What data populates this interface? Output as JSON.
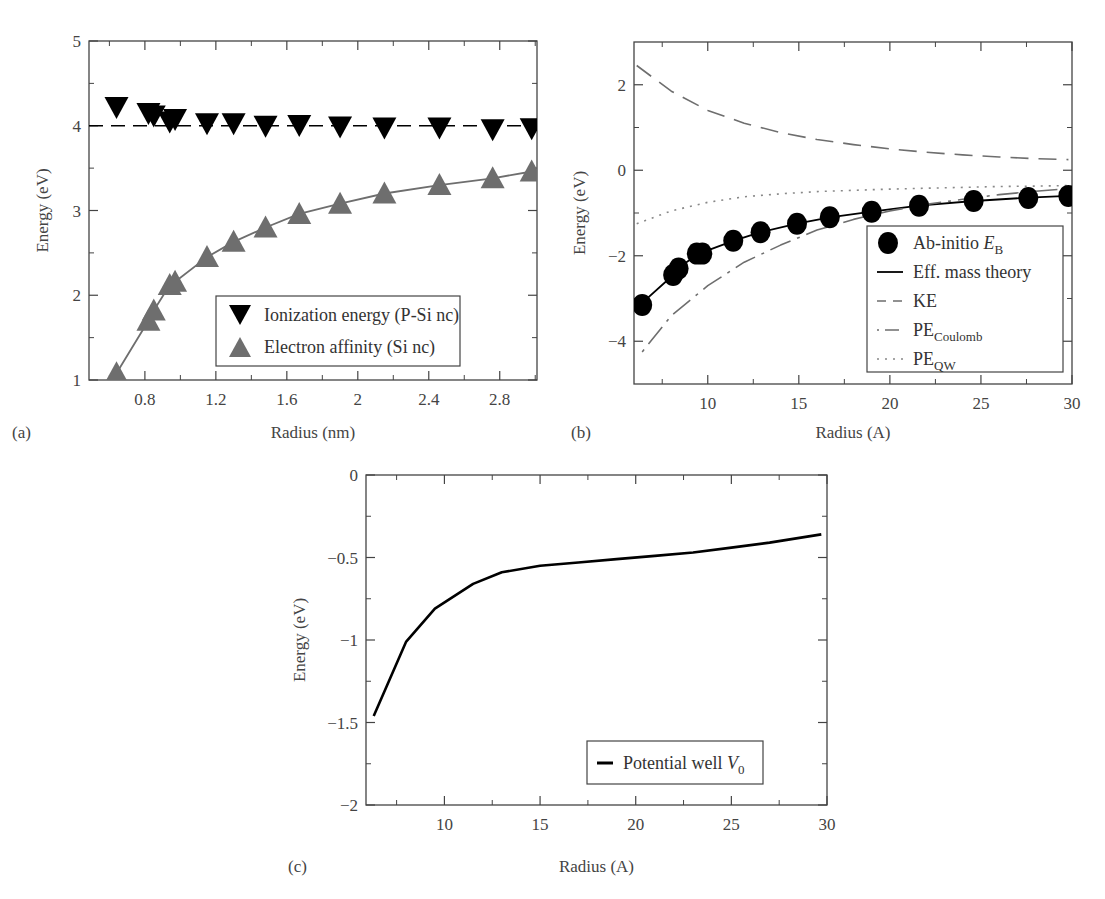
{
  "figure": {
    "panels": [
      "(a)",
      "(b)",
      "(c)"
    ]
  },
  "chart_data": [
    {
      "id": "a",
      "panel_label": "(a)",
      "type": "scatter",
      "title": "",
      "xlabel": "Radius (nm)",
      "ylabel": "Energy (eV)",
      "xlim": [
        0.485,
        3.01
      ],
      "ylim": [
        1,
        5
      ],
      "xticks": [
        0.8,
        1.2,
        1.6,
        2,
        2.4,
        2.8
      ],
      "xtick_labels": [
        "0.8",
        "1.2",
        "1.6",
        "2",
        "2.4",
        "2.8"
      ],
      "yticks": [
        1,
        2,
        3,
        4,
        5
      ],
      "ytick_labels": [
        "1",
        "2",
        "3",
        "4",
        "5"
      ],
      "x_minor_step": 0.2,
      "y_minor_step": 0.5,
      "grid": false,
      "legend_position": "lower right",
      "series": [
        {
          "name": "Ionization energy (P-Si nc)",
          "marker": "triangle-down",
          "color": "#000000",
          "x": [
            0.64,
            0.82,
            0.85,
            0.94,
            0.97,
            1.15,
            1.3,
            1.48,
            1.67,
            1.9,
            2.15,
            2.46,
            2.76,
            2.98
          ],
          "y": [
            4.22,
            4.15,
            4.12,
            4.05,
            4.08,
            4.03,
            4.03,
            4.0,
            4.01,
            3.99,
            3.98,
            3.98,
            3.96,
            3.97
          ]
        },
        {
          "name": "Electron affinity (Si nc)",
          "marker": "triangle-up",
          "color": "#6e6e6e",
          "line": "solid",
          "x": [
            0.64,
            0.82,
            0.85,
            0.94,
            0.97,
            1.15,
            1.3,
            1.48,
            1.67,
            1.9,
            2.15,
            2.46,
            2.76,
            2.98
          ],
          "y": [
            1.08,
            1.7,
            1.82,
            2.12,
            2.16,
            2.45,
            2.63,
            2.8,
            2.96,
            3.08,
            3.2,
            3.3,
            3.38,
            3.46
          ]
        },
        {
          "name": "reference",
          "marker": "none",
          "line": "dashed",
          "color": "#000000",
          "x": [
            0.485,
            3.01
          ],
          "y": [
            4.0,
            4.0
          ]
        }
      ]
    },
    {
      "id": "b",
      "panel_label": "(b)",
      "type": "line",
      "title": "",
      "xlabel": "Radius (A)",
      "ylabel": "Energy (eV)",
      "xlim": [
        5.95,
        30
      ],
      "ylim": [
        -5,
        3
      ],
      "xticks": [
        10,
        15,
        20,
        25,
        30
      ],
      "xtick_labels": [
        "10",
        "15",
        "20",
        "25",
        "30"
      ],
      "yticks": [
        -4,
        -2,
        0,
        2
      ],
      "ytick_labels": [
        "−4",
        "−2",
        "0",
        "2"
      ],
      "x_minor_step": 2.5,
      "y_minor_step": 1,
      "grid": false,
      "legend_position": "lower right",
      "series": [
        {
          "name": "Ab-initio E_B",
          "legend_main": "Ab-initio ",
          "legend_italic": "E",
          "legend_sub": "B",
          "marker": "circle",
          "color": "#000000",
          "x": [
            6.4,
            8.1,
            8.4,
            9.4,
            9.7,
            11.4,
            12.9,
            14.9,
            16.7,
            19.0,
            21.6,
            24.6,
            27.6,
            29.8
          ],
          "y": [
            -3.15,
            -2.45,
            -2.3,
            -1.95,
            -1.95,
            -1.65,
            -1.45,
            -1.25,
            -1.1,
            -0.97,
            -0.83,
            -0.72,
            -0.65,
            -0.6
          ]
        },
        {
          "name": "Eff. mass theory",
          "legend_main": "Eff. mass theory",
          "line": "solid",
          "color": "#000000",
          "x": [
            6.4,
            8.1,
            8.4,
            9.4,
            9.7,
            11.4,
            12.9,
            14.9,
            16.7,
            19.0,
            21.6,
            24.6,
            27.6,
            29.8
          ],
          "y": [
            -3.1,
            -2.45,
            -2.28,
            -1.98,
            -1.92,
            -1.65,
            -1.45,
            -1.25,
            -1.1,
            -0.97,
            -0.83,
            -0.72,
            -0.64,
            -0.6
          ]
        },
        {
          "name": "KE",
          "legend_main": "KE",
          "line": "long-dash",
          "color": "#6e6e6e",
          "x": [
            6.1,
            8,
            10,
            12,
            14,
            16,
            18,
            20,
            22,
            24,
            26,
            28,
            29.8
          ],
          "y": [
            2.45,
            1.85,
            1.4,
            1.1,
            0.88,
            0.72,
            0.6,
            0.5,
            0.42,
            0.36,
            0.31,
            0.27,
            0.25
          ]
        },
        {
          "name": "PE_Coulomb",
          "legend_main": "PE",
          "legend_sub": "Coulomb",
          "line": "dash-dot",
          "color": "#6e6e6e",
          "x": [
            6.4,
            8,
            10,
            12,
            14,
            16,
            18,
            20,
            22,
            24,
            26,
            28,
            29.8
          ],
          "y": [
            -4.25,
            -3.4,
            -2.7,
            -2.15,
            -1.75,
            -1.4,
            -1.15,
            -0.95,
            -0.8,
            -0.68,
            -0.57,
            -0.49,
            -0.43
          ]
        },
        {
          "name": "PE_QW",
          "legend_main": "PE",
          "legend_sub": "QW",
          "line": "dotted",
          "color": "#888888",
          "x": [
            6.1,
            8,
            10,
            12,
            14,
            16,
            18,
            20,
            22,
            24,
            26,
            28,
            29.8
          ],
          "y": [
            -1.25,
            -0.95,
            -0.75,
            -0.62,
            -0.55,
            -0.5,
            -0.47,
            -0.44,
            -0.42,
            -0.4,
            -0.38,
            -0.37,
            -0.36
          ]
        }
      ]
    },
    {
      "id": "c",
      "panel_label": "(c)",
      "type": "line",
      "title": "",
      "xlabel": "Radius (A)",
      "ylabel": "Energy (eV)",
      "xlim": [
        5.9,
        30
      ],
      "ylim": [
        -2,
        0
      ],
      "xticks": [
        10,
        15,
        20,
        25,
        30
      ],
      "xtick_labels": [
        "10",
        "15",
        "20",
        "25",
        "30"
      ],
      "yticks": [
        -2,
        -1.5,
        -1,
        -0.5,
        0
      ],
      "ytick_labels": [
        "−2",
        "−1.5",
        "−1",
        "−0.5",
        "0"
      ],
      "x_minor_step": 2.5,
      "y_minor_step": 0.25,
      "grid": false,
      "legend_position": "lower right",
      "series": [
        {
          "name": "Potential well V_0",
          "legend_main": "Potential well ",
          "legend_italic": "V",
          "legend_sub": "0",
          "line": "solid",
          "color": "#000000",
          "x": [
            6.3,
            8.0,
            9.5,
            11.5,
            13.0,
            15.0,
            17.0,
            19.0,
            21.0,
            23.0,
            25.0,
            27.0,
            29.7
          ],
          "y": [
            -1.46,
            -1.01,
            -0.81,
            -0.66,
            -0.59,
            -0.55,
            -0.53,
            -0.51,
            -0.49,
            -0.47,
            -0.44,
            -0.41,
            -0.36
          ]
        }
      ]
    }
  ]
}
